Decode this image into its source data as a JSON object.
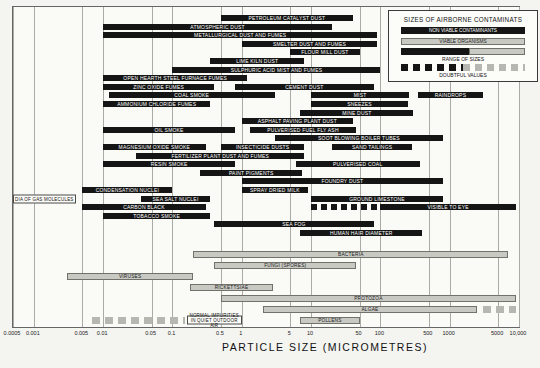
{
  "chart_data": {
    "type": "bar",
    "subtype": "horizontal-range-log",
    "xlabel": "PARTICLE SIZE (MICROMETRES)",
    "x_axis": {
      "scale": "log",
      "min": 0.0005,
      "max": 10000,
      "ticks": [
        {
          "label": "0.0005",
          "value": 0.0005
        },
        {
          "label": "0.001",
          "value": 0.001
        },
        {
          "label": "0.005",
          "value": 0.005
        },
        {
          "label": "0.01",
          "value": 0.01
        },
        {
          "label": "0.05",
          "value": 0.05
        },
        {
          "label": "0.1",
          "value": 0.1
        },
        {
          "label": "0.5",
          "value": 0.5
        },
        {
          "label": "1",
          "value": 1
        },
        {
          "label": "5",
          "value": 5
        },
        {
          "label": "10",
          "value": 10
        },
        {
          "label": "50",
          "value": 50
        },
        {
          "label": "100",
          "value": 100
        },
        {
          "label": "500",
          "value": 500
        },
        {
          "label": "1000",
          "value": 1000
        },
        {
          "label": "5000",
          "value": 5000
        },
        {
          "label": "10,000",
          "value": 10000
        }
      ]
    },
    "colors": {
      "nonviable": "#151515",
      "viable": "#c9c9c4",
      "grid": "#ababa6",
      "plot_border": "#666666"
    },
    "legend": {
      "title": "SIZES OF AIRBORNE CONTAMINATS",
      "nonviable_label": "NON VIABLE CONTAMINANTS",
      "viable_label": "VIABLE ORGANISMS",
      "range_caption": "RANGE OF SIZES",
      "doubtful_caption": "DOUBTFUL VALUES"
    },
    "rows": [
      {
        "bars": [
          {
            "label": "PETROLEUM CATALYST DUST",
            "lo": 0.5,
            "hi": 40,
            "kind": "nonviable"
          }
        ]
      },
      {
        "bars": [
          {
            "label": "ATMOSPHERIC DUST",
            "lo": 0.01,
            "hi": 20,
            "kind": "nonviable"
          }
        ]
      },
      {
        "bars": [
          {
            "label": "METALLURGICAL DUST AND FUMES",
            "lo": 0.01,
            "hi": 90,
            "kind": "nonviable"
          }
        ]
      },
      {
        "bars": [
          {
            "label": "SMELTER DUST AND FUMES",
            "lo": 1,
            "hi": 90,
            "kind": "nonviable"
          }
        ]
      },
      {
        "bars": [
          {
            "label": "FLOUR MILL DUST",
            "lo": 5,
            "hi": 50,
            "kind": "nonviable"
          }
        ]
      },
      {
        "bars": [
          {
            "label": "LIME KILN DUST",
            "lo": 0.35,
            "hi": 8,
            "kind": "nonviable"
          }
        ]
      },
      {
        "bars": [
          {
            "label": "SULPHURIC ACID MIST AND FUMES",
            "lo": 0.1,
            "hi": 100,
            "kind": "nonviable"
          }
        ]
      },
      {
        "bars": [
          {
            "label": "OPEN HEARTH STEEL FURNACE FUMES",
            "lo": 0.01,
            "hi": 1.2,
            "kind": "nonviable"
          }
        ]
      },
      {
        "bars": [
          {
            "label": "ZINC OXIDE FUMES",
            "lo": 0.01,
            "hi": 0.4,
            "kind": "nonviable"
          },
          {
            "label": "CEMENT DUST",
            "lo": 0.8,
            "hi": 80,
            "kind": "nonviable"
          }
        ]
      },
      {
        "bars": [
          {
            "label": "COAL SMOKE",
            "lo": 0.012,
            "hi": 3,
            "kind": "nonviable"
          },
          {
            "label": "MIST",
            "lo": 10,
            "hi": 260,
            "kind": "nonviable"
          },
          {
            "label": "RAINDROPS",
            "lo": 350,
            "hi": 3000,
            "kind": "nonviable"
          }
        ]
      },
      {
        "bars": [
          {
            "label": "AMMONIUM CHLORIDE FUMES",
            "lo": 0.01,
            "hi": 0.35,
            "kind": "nonviable"
          },
          {
            "label": "SNEEZES",
            "lo": 10,
            "hi": 250,
            "kind": "nonviable"
          }
        ]
      },
      {
        "bars": [
          {
            "label": "MINE DUST",
            "lo": 7,
            "hi": 300,
            "kind": "nonviable"
          }
        ]
      },
      {
        "bars": [
          {
            "label": "ASPHALT PAVING PLANT DUST",
            "lo": 1,
            "hi": 40,
            "kind": "nonviable"
          }
        ]
      },
      {
        "bars": [
          {
            "label": "OIL SMOKE",
            "lo": 0.01,
            "hi": 0.8,
            "kind": "nonviable"
          },
          {
            "label": "PULVERISED FUEL FLY ASH",
            "lo": 1.3,
            "hi": 45,
            "kind": "nonviable"
          }
        ]
      },
      {
        "bars": [
          {
            "label": "SOOT BLOWING BOILER TUBES",
            "lo": 3,
            "hi": 800,
            "kind": "nonviable"
          }
        ]
      },
      {
        "bars": [
          {
            "label": "MAGNESIUM OXIDE SMOKE",
            "lo": 0.01,
            "hi": 0.3,
            "kind": "nonviable"
          },
          {
            "label": "INSECTICIDE DUSTS",
            "lo": 0.5,
            "hi": 8,
            "kind": "nonviable"
          },
          {
            "label": "SAND TAILINGS",
            "lo": 20,
            "hi": 290,
            "kind": "nonviable"
          }
        ]
      },
      {
        "bars": [
          {
            "label": "FERTILIZER PLANT DUST AND FUMES",
            "lo": 0.03,
            "hi": 8,
            "kind": "nonviable"
          }
        ]
      },
      {
        "bars": [
          {
            "label": "RESIN SMOKE",
            "lo": 0.01,
            "hi": 0.8,
            "kind": "nonviable"
          },
          {
            "label": "PULVERISED COAL",
            "lo": 6,
            "hi": 370,
            "kind": "nonviable"
          }
        ]
      },
      {
        "bars": [
          {
            "label": "PAINT PIGMENTS",
            "lo": 0.25,
            "hi": 7.5,
            "kind": "nonviable"
          }
        ]
      },
      {
        "bars": [
          {
            "label": "FOUNDRY DUST",
            "lo": 1,
            "hi": 800,
            "kind": "nonviable"
          }
        ]
      },
      {
        "bars": [
          {
            "label": "CONDENSATION NUCLEI",
            "lo": 0.005,
            "hi": 0.1,
            "kind": "nonviable"
          },
          {
            "label": "SPRAY DRIED MILK",
            "lo": 1,
            "hi": 9,
            "kind": "nonviable"
          }
        ]
      },
      {
        "bars": [
          {
            "label": "DIA OF GAS MOLECULES",
            "lo": 0.0005,
            "hi": 0.004,
            "kind": "labelbox"
          },
          {
            "label": "SEA SALT NUCLEI",
            "lo": 0.035,
            "hi": 0.35,
            "kind": "nonviable"
          },
          {
            "label": "GROUND LIMESTONE",
            "lo": 10,
            "hi": 800,
            "kind": "nonviable"
          }
        ]
      },
      {
        "bars": [
          {
            "label": "CARBON BLACK",
            "lo": 0.005,
            "hi": 0.3,
            "kind": "nonviable"
          },
          {
            "label": "",
            "lo": 10,
            "hi": 90,
            "kind": "dashed-nonviable"
          },
          {
            "label": "VISIBLE TO EYE",
            "lo": 100,
            "hi": 9000,
            "kind": "nonviable"
          }
        ]
      },
      {
        "bars": [
          {
            "label": "TOBACCO SMOKE",
            "lo": 0.01,
            "hi": 0.35,
            "kind": "nonviable"
          }
        ]
      },
      {
        "bars": [
          {
            "label": "SEA FOG",
            "lo": 0.4,
            "hi": 80,
            "kind": "nonviable"
          }
        ]
      },
      {
        "bars": [
          {
            "label": "HUMAN HAIR DIAMETER",
            "lo": 7,
            "hi": 400,
            "kind": "nonviable"
          }
        ]
      },
      {
        "bars": [
          {
            "label": "BACTERIA",
            "lo": 0.2,
            "hi": 7000,
            "kind": "viable"
          }
        ]
      },
      {
        "bars": [
          {
            "label": "FUNGI (SPORES)",
            "lo": 0.4,
            "hi": 45,
            "kind": "viable"
          }
        ]
      },
      {
        "bars": [
          {
            "label": "VIRUSES",
            "lo": 0.003,
            "hi": 0.2,
            "kind": "viable"
          }
        ]
      },
      {
        "bars": [
          {
            "label": "RICKETTSIAE",
            "lo": 0.18,
            "hi": 2.8,
            "kind": "viable"
          }
        ]
      },
      {
        "bars": [
          {
            "label": "PROTOZOA",
            "lo": 0.5,
            "hi": 9000,
            "kind": "viable"
          }
        ]
      },
      {
        "bars": [
          {
            "label": "ALGAE",
            "lo": 2,
            "hi": 2500,
            "kind": "viable"
          },
          {
            "label": "",
            "lo": 3000,
            "hi": 9000,
            "kind": "dashed-viable"
          }
        ]
      },
      {
        "bars": [
          {
            "label": "",
            "lo": 0.007,
            "hi": 0.15,
            "kind": "dashed-viable"
          },
          {
            "label": "NORMAL IMPURITIES IN QUIET OUTDOOR AIR",
            "lo": 0.16,
            "hi": 1.0,
            "kind": "labelbox"
          },
          {
            "label": "POLLENS",
            "lo": 7,
            "hi": 50,
            "kind": "viable"
          }
        ]
      }
    ]
  }
}
